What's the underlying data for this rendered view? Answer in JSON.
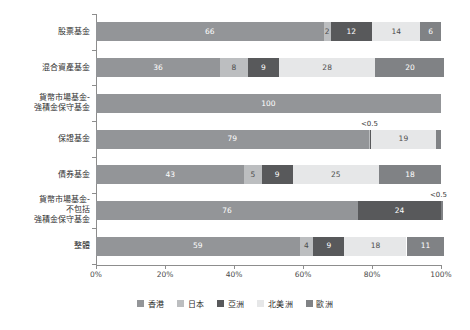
{
  "chart_data": {
    "type": "bar",
    "orientation": "horizontal",
    "stacked": true,
    "stacked_percent": true,
    "title": "",
    "subtitle": "",
    "xlabel": "",
    "ylabel": "",
    "xlim": [
      0,
      100
    ],
    "xtick_labels": [
      "0%",
      "20%",
      "40%",
      "60%",
      "80%",
      "100%"
    ],
    "xtick_values": [
      0,
      20,
      40,
      60,
      80,
      100
    ],
    "grid": false,
    "legend_position": "bottom",
    "categories": [
      "股票基金",
      "混合資產基金",
      "貨幣市場基金-\n強積金保守基金",
      "保證基金",
      "債券基金",
      "貨幣市場基金-\n不包括\n強積金保守基金",
      "整體"
    ],
    "category_lines": [
      [
        "股票基金"
      ],
      [
        "混合資產基金"
      ],
      [
        "貨幣市場基金-",
        "強積金保守基金"
      ],
      [
        "保證基金"
      ],
      [
        "債券基金"
      ],
      [
        "貨幣市場基金-",
        "不包括",
        "強積金保守基金"
      ],
      [
        "整體"
      ]
    ],
    "series": [
      {
        "name": "香港",
        "color": "#939598",
        "values": [
          66,
          36,
          100,
          79,
          43,
          76,
          59
        ]
      },
      {
        "name": "日本",
        "color": "#bcbec0",
        "values": [
          2,
          8,
          0,
          0.3,
          5,
          0,
          4
        ]
      },
      {
        "name": "亞洲",
        "color": "#58595b",
        "values": [
          12,
          9,
          0,
          0.3,
          9,
          24,
          9
        ]
      },
      {
        "name": "北美洲",
        "color": "#e6e7e8",
        "values": [
          14,
          28,
          0,
          19,
          25,
          0,
          18
        ]
      },
      {
        "name": "歐洲",
        "color": "#808285",
        "values": [
          6,
          20,
          0,
          1.4,
          18,
          0.3,
          11
        ]
      }
    ],
    "value_labels": [
      [
        "66",
        "2",
        "12",
        "14",
        "6"
      ],
      [
        "36",
        "8",
        "9",
        "28",
        "20"
      ],
      [
        "100",
        "",
        "",
        "",
        ""
      ],
      [
        "79",
        "",
        "",
        "19",
        ""
      ],
      [
        "43",
        "5",
        "9",
        "25",
        "18"
      ],
      [
        "76",
        "",
        "24",
        "",
        ""
      ],
      [
        "59",
        "4",
        "9",
        "18",
        "11"
      ]
    ],
    "annotations": [
      {
        "text": "<0.5",
        "row": 3,
        "x_percent": 80,
        "note": "above 保證基金 thin Japan/Asia segment"
      },
      {
        "text": "<0.5",
        "row": 5,
        "x_percent": 100,
        "note": "above 貨幣市場基金-不包括強積金保守基金 right end"
      }
    ],
    "legend_entries": [
      {
        "label": "香港",
        "color": "#939598"
      },
      {
        "label": "日本",
        "color": "#bcbec0"
      },
      {
        "label": "亞洲",
        "color": "#58595b"
      },
      {
        "label": "北美洲",
        "color": "#e6e7e8"
      },
      {
        "label": "歐洲",
        "color": "#808285"
      }
    ]
  }
}
